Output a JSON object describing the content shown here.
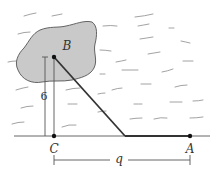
{
  "diagram": {
    "type": "geometry-word-problem",
    "colors": {
      "island_fill": "#c9c9c9",
      "island_stroke": "#555555",
      "line": "#333333",
      "water_strokes": "#8a8a8a",
      "dim_line": "#555555"
    },
    "points": {
      "B": {
        "label": "B",
        "x": 54,
        "y": 57
      },
      "C": {
        "label": "C",
        "x": 54,
        "y": 136
      },
      "A": {
        "label": "A",
        "x": 190,
        "y": 136
      },
      "P": {
        "label": "",
        "x": 125,
        "y": 136
      }
    },
    "dimensions": {
      "vertical": {
        "label": "6"
      },
      "horizontal": {
        "label": "q"
      }
    },
    "features": {
      "island": "island",
      "shore": "shoreline",
      "water": "water"
    }
  }
}
